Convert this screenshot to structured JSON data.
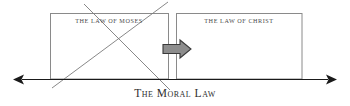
{
  "diagram": {
    "title_caption": "The Moral Law",
    "boxes": [
      {
        "id": "law-of-moses",
        "label": "The Law of Moses",
        "struck_out": true,
        "x": 50,
        "y": 13,
        "width": 118,
        "height": 66
      },
      {
        "id": "law-of-christ",
        "label": "The Law of Christ",
        "struck_out": false,
        "x": 176,
        "y": 13,
        "width": 126,
        "height": 66
      }
    ],
    "transition_arrow": {
      "name": "right-block-arrow",
      "direction": "right",
      "fill_color": "#8d8d8d",
      "stroke_color": "#3a3a3a"
    },
    "baseline": {
      "name": "moral-law-axis",
      "y": 79,
      "x_start": 18,
      "x_end": 332,
      "arrowheads": "both",
      "color": "#1a1a1a"
    },
    "strikeout": {
      "name": "cross-out-lines",
      "color": "#7a7a7a"
    },
    "colors": {
      "background": "#ffffff",
      "box_border": "#8a8a8a",
      "label_text": "#4a4a4a",
      "caption_text": "#2e2e2e",
      "arrow_fill": "#8d8d8d",
      "arrow_stroke": "#3a3a3a",
      "axis": "#1a1a1a",
      "strike": "#7a7a7a"
    }
  }
}
